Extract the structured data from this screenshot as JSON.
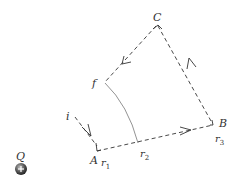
{
  "diagram": {
    "charge": {
      "label": "Q",
      "sign": "+",
      "color": "#555555"
    },
    "points": {
      "A": "A",
      "B": "B",
      "C": "C",
      "i": "i",
      "f": "f"
    },
    "radii": {
      "r1": {
        "base": "r",
        "sub": "1"
      },
      "r2": {
        "base": "r",
        "sub": "2"
      },
      "r3": {
        "base": "r",
        "sub": "3"
      }
    },
    "colors": {
      "path": "#333333",
      "arc": "#777777"
    }
  }
}
